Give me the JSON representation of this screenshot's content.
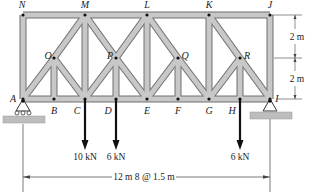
{
  "figure": {
    "joints": {
      "top": [
        "N",
        "M",
        "L",
        "K",
        "J"
      ],
      "middle": [
        "O",
        "P",
        "Q",
        "R"
      ],
      "bottom": [
        "A",
        "B",
        "C",
        "D",
        "E",
        "F",
        "G",
        "H",
        "I"
      ]
    },
    "loads": [
      {
        "joint": "C",
        "label": "10 kN"
      },
      {
        "joint": "D",
        "label": "6 kN"
      },
      {
        "joint": "H",
        "label": "6 kN"
      }
    ],
    "dimensions": {
      "height_upper": "2 m",
      "height_lower": "2 m",
      "span": "12 m 8 @ 1.5 m"
    },
    "colors": {
      "member_fill": "#c8c8c8",
      "member_stroke": "#6e6e6e",
      "ground": "#bdbdbd",
      "line": "#222222"
    }
  }
}
